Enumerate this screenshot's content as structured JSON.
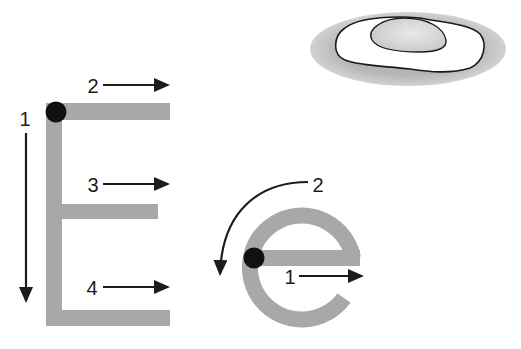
{
  "worksheet": {
    "letters": "Ee",
    "colors": {
      "stroke_guide": "#a8a8a8",
      "start_dot": "#111111",
      "arrow": "#1c1c1c",
      "egg_shadow": "#b9b9b9",
      "egg_white": "#ffffff",
      "egg_yolk": "#d8d8d8"
    },
    "uppercase_E": {
      "steps": [
        {
          "number": "1",
          "direction": "down"
        },
        {
          "number": "2",
          "direction": "right"
        },
        {
          "number": "3",
          "direction": "right"
        },
        {
          "number": "4",
          "direction": "right"
        }
      ]
    },
    "lowercase_e": {
      "steps": [
        {
          "number": "1",
          "direction": "right"
        },
        {
          "number": "2",
          "direction": "counter-clockwise"
        }
      ]
    },
    "picture": {
      "icon": "fried-egg-icon"
    }
  }
}
